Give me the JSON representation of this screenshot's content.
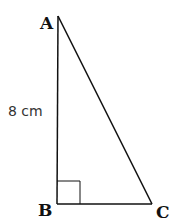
{
  "diagram": {
    "type": "right-triangle",
    "vertices": {
      "A": "A",
      "B": "B",
      "C": "C"
    },
    "right_angle_at": "B",
    "side_labels": {
      "AB": "8 cm"
    },
    "stroke_color": "#111111"
  }
}
